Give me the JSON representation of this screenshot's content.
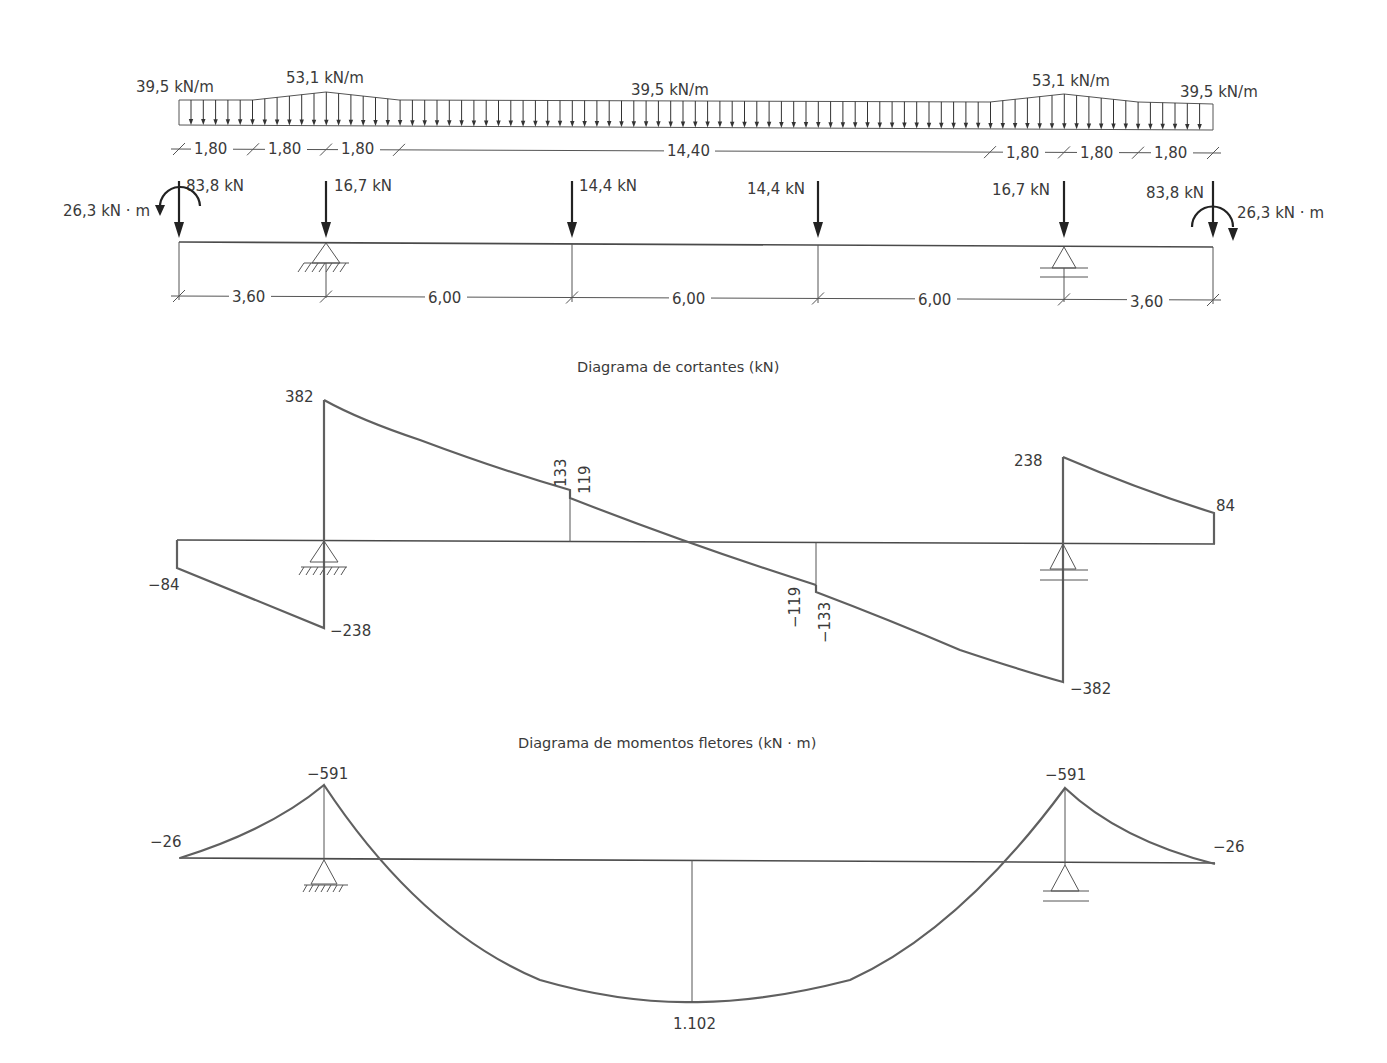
{
  "load_diagram": {
    "distributed_loads": {
      "labels": [
        {
          "text": "39,5 kN/m",
          "x": 136,
          "y": 92
        },
        {
          "text": "53,1 kN/m",
          "x": 286,
          "y": 83
        },
        {
          "text": "39,5 kN/m",
          "x": 631,
          "y": 95
        },
        {
          "text": "53,1 kN/m",
          "x": 1032,
          "y": 86
        },
        {
          "text": "39,5 kN/m",
          "x": 1180,
          "y": 97
        }
      ],
      "profile_points": [
        [
          179,
          100
        ],
        [
          253,
          100
        ],
        [
          326,
          92
        ],
        [
          399,
          100
        ],
        [
          990,
          102
        ],
        [
          1064,
          94
        ],
        [
          1138,
          102
        ],
        [
          1213,
          104
        ]
      ],
      "baseline": [
        [
          179,
          125
        ],
        [
          1213,
          130
        ]
      ]
    },
    "top_dimensions": [
      {
        "text": "1,80",
        "x": 194,
        "y": 154
      },
      {
        "text": "1,80",
        "x": 268,
        "y": 154
      },
      {
        "text": "1,80",
        "x": 341,
        "y": 154
      },
      {
        "text": "14,40",
        "x": 667,
        "y": 156
      },
      {
        "text": "1,80",
        "x": 1006,
        "y": 158
      },
      {
        "text": "1,80",
        "x": 1080,
        "y": 158
      },
      {
        "text": "1,80",
        "x": 1154,
        "y": 158
      }
    ],
    "top_dimension_ticks": [
      179,
      253,
      326,
      399,
      990,
      1064,
      1138,
      1213
    ],
    "point_loads": [
      {
        "label": "83,8 kN",
        "x": 179,
        "label_x": 186,
        "label_y": 191
      },
      {
        "label": "16,7 kN",
        "x": 326,
        "label_x": 334,
        "label_y": 191
      },
      {
        "label": "14,4 kN",
        "x": 572,
        "label_x": 579,
        "label_y": 191
      },
      {
        "label": "14,4 kN",
        "x": 818,
        "label_x": 747,
        "label_y": 194
      },
      {
        "label": "16,7 kN",
        "x": 1064,
        "label_x": 992,
        "label_y": 195
      },
      {
        "label": "83,8 kN",
        "x": 1213,
        "label_x": 1146,
        "label_y": 198
      }
    ],
    "moments": [
      {
        "label": "26,3 kN · m",
        "side": "left",
        "label_x": 63,
        "label_y": 216
      },
      {
        "label": "26,3 kN · m",
        "side": "right",
        "label_x": 1237,
        "label_y": 218
      }
    ],
    "beam_line": [
      [
        179,
        242
      ],
      [
        1213,
        247
      ]
    ],
    "supports": [
      {
        "type": "pinned",
        "x": 326
      },
      {
        "type": "roller",
        "x": 1064
      }
    ],
    "bottom_dimensions": [
      {
        "text": "3,60",
        "x": 232,
        "y": 302
      },
      {
        "text": "6,00",
        "x": 428,
        "y": 303
      },
      {
        "text": "6,00",
        "x": 672,
        "y": 304
      },
      {
        "text": "6,00",
        "x": 918,
        "y": 305
      },
      {
        "text": "3,60",
        "x": 1130,
        "y": 307
      }
    ],
    "bottom_dimension_ticks": [
      179,
      326,
      572,
      818,
      1064,
      1213
    ]
  },
  "shear_diagram": {
    "title": "Diagrama de cortantes (kN)",
    "values": [
      {
        "text": "382",
        "x": 285,
        "y": 402
      },
      {
        "text": "133",
        "rotated": true,
        "x": 566,
        "y": 487
      },
      {
        "text": "119",
        "rotated": true,
        "x": 590,
        "y": 494
      },
      {
        "text": "238",
        "x": 1014,
        "y": 466
      },
      {
        "text": "84",
        "x": 1216,
        "y": 511
      },
      {
        "text": "−84",
        "x": 148,
        "y": 590
      },
      {
        "text": "−238",
        "x": 330,
        "y": 636
      },
      {
        "text": "−119",
        "rotated": true,
        "x": 800,
        "y": 628
      },
      {
        "text": "−133",
        "rotated": true,
        "x": 830,
        "y": 643
      },
      {
        "text": "−382",
        "x": 1070,
        "y": 694
      }
    ]
  },
  "moment_diagram": {
    "title": "Diagrama de momentos fletores (kN · m)",
    "values": [
      {
        "text": "−591",
        "x": 307,
        "y": 779
      },
      {
        "text": "−591",
        "x": 1045,
        "y": 780
      },
      {
        "text": "−26",
        "x": 150,
        "y": 847
      },
      {
        "text": "−26",
        "x": 1213,
        "y": 852
      },
      {
        "text": "1.102",
        "x": 673,
        "y": 1029
      }
    ]
  },
  "chart_data": [
    {
      "type": "line",
      "title": "Diagrama de cortantes (kN)",
      "xlabel": "Position along beam (m)",
      "ylabel": "Shear (kN)",
      "x": [
        0,
        3.6,
        3.6,
        9.6,
        9.6,
        15.6,
        15.6,
        21.6,
        21.6,
        25.2
      ],
      "series": [
        {
          "name": "Cortante",
          "values": [
            -84,
            -238,
            382,
            133,
            119,
            -119,
            -133,
            -382,
            238,
            84
          ]
        }
      ],
      "grid": false
    },
    {
      "type": "line",
      "title": "Diagrama de momentos fletores (kN · m)",
      "xlabel": "Position along beam (m)",
      "ylabel": "Moment (kN · m)",
      "x": [
        0,
        3.6,
        12.6,
        21.6,
        25.2
      ],
      "series": [
        {
          "name": "Momento fletor",
          "values": [
            -26,
            -591,
            1102,
            -591,
            -26
          ]
        }
      ],
      "grid": false
    }
  ]
}
